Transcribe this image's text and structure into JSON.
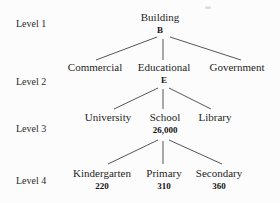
{
  "figure": {
    "background": "#fcfcfc",
    "text_color": "#1f1f1f",
    "line_color": "#3a3a3a"
  },
  "levels": [
    {
      "label": "Level 1"
    },
    {
      "label": "Level 2"
    },
    {
      "label": "Level 3"
    },
    {
      "label": "Level 4"
    }
  ],
  "nodes": {
    "building": {
      "label": "Building",
      "code": "B"
    },
    "commercial": {
      "label": "Commercial"
    },
    "educational": {
      "label": "Educational",
      "code": "E"
    },
    "government": {
      "label": "Government"
    },
    "university": {
      "label": "University"
    },
    "school": {
      "label": "School",
      "value": "26,000"
    },
    "library": {
      "label": "Library"
    },
    "kindergarten": {
      "label": "Kindergarten",
      "value": "220"
    },
    "primary": {
      "label": "Primary",
      "value": "310"
    },
    "secondary": {
      "label": "Secondary",
      "value": "360"
    }
  },
  "edges": [
    {
      "from": "building",
      "to": "commercial"
    },
    {
      "from": "building",
      "to": "educational"
    },
    {
      "from": "building",
      "to": "government"
    },
    {
      "from": "educational",
      "to": "university"
    },
    {
      "from": "educational",
      "to": "school"
    },
    {
      "from": "educational",
      "to": "library"
    },
    {
      "from": "school",
      "to": "kindergarten"
    },
    {
      "from": "school",
      "to": "primary"
    },
    {
      "from": "school",
      "to": "secondary"
    }
  ]
}
